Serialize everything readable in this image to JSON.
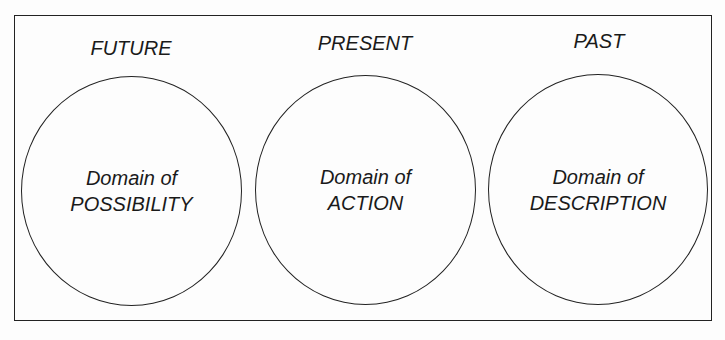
{
  "diagram": {
    "columns": [
      {
        "heading": "FUTURE",
        "line1": "Domain of",
        "line2": "POSSIBILITY"
      },
      {
        "heading": "PRESENT",
        "line1": "Domain of",
        "line2": "ACTION"
      },
      {
        "heading": "PAST",
        "line1": "Domain of",
        "line2": "DESCRIPTION"
      }
    ]
  }
}
